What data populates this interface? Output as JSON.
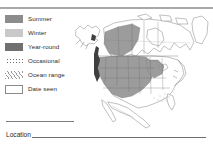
{
  "page": {
    "kind": "field-guide-range-map-panel",
    "background_color": "#ffffff",
    "rule_color": "#a9a9a9"
  },
  "legend": {
    "name": "range-map-legend",
    "items": [
      {
        "label": "Summer",
        "swatch": "filled-square",
        "color": "#8c8c8c"
      },
      {
        "label": "Winter",
        "swatch": "filled-square",
        "color": "#c9c9c9"
      },
      {
        "label": "Year-round",
        "swatch": "filled-square",
        "color": "#707070"
      },
      {
        "label": "Occasional",
        "swatch": "dotted-square",
        "color": "#6e6e6e"
      },
      {
        "label": "Ocean range",
        "swatch": "hatched-square",
        "color": "#9a9a9a"
      },
      {
        "label": "Date seen",
        "swatch": "outlined-square",
        "color": "#8a8a8a"
      }
    ]
  },
  "location_field": {
    "label": "Location",
    "value": "",
    "line_color": "#6e6e6e"
  },
  "map": {
    "name": "north-america-range-map",
    "title": "North America",
    "regions_shown": [
      "Alaska",
      "Canada",
      "United States",
      "Mexico",
      "Greenland"
    ],
    "shaded_area_label": "Summer",
    "shaded_color": "#8c8c8c",
    "coast_accent_label": "Year-round",
    "coast_accent_color": "#4a4a4a",
    "outline_color": "#8d8d8d"
  }
}
